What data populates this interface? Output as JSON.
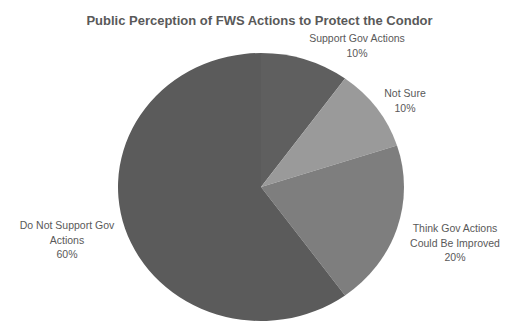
{
  "chart_data": {
    "type": "pie",
    "title": "Public Perception of FWS Actions to Protect the Condor",
    "categories": [
      "Support Gov Actions",
      "Not Sure",
      "Think Gov Actions Could Be Improved",
      "Do Not Support Gov Actions"
    ],
    "values": [
      10,
      10,
      20,
      60
    ],
    "value_unit": "%",
    "colors": [
      "#5f5f5f",
      "#9a9a9a",
      "#7e7e7e",
      "#5b5b5b"
    ],
    "start_angle": "12 o'clock, clockwise",
    "legend": "none (data labels with category name and percent)"
  },
  "labels": {
    "support": {
      "line1": "Support Gov Actions",
      "pct": "10%"
    },
    "notsure": {
      "line1": "Not Sure",
      "pct": "10%"
    },
    "improve": {
      "line1": "Think Gov Actions",
      "line2": "Could Be Improved",
      "pct": "20%"
    },
    "notsupport": {
      "line1": "Do Not Support Gov",
      "line2": "Actions",
      "pct": "60%"
    }
  }
}
